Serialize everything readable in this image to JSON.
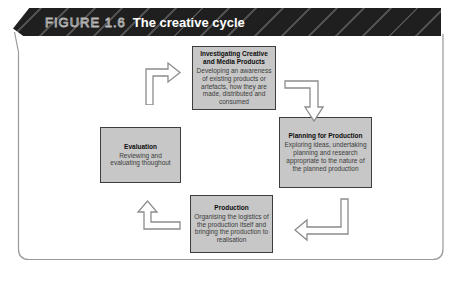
{
  "figure": {
    "label": "FIGURE 1.6",
    "title": "The creative cycle"
  },
  "cycle": {
    "nodes": [
      {
        "id": "investigating",
        "title": "Investigating Creative and Media Products",
        "body": "Developing an awareness of existing products or artefacts, how they are made, distributed and consumed"
      },
      {
        "id": "planning",
        "title": "Planning for Production",
        "body": "Exploring ideas, undertaking planning and research appropriate to the nature of the planned production"
      },
      {
        "id": "production",
        "title": "Production",
        "body": "Organising the logistics of the production itself and bringing the production to realisation"
      },
      {
        "id": "evaluation",
        "title": "Evaluation",
        "body": "Reviewing and evaluating thoughout"
      }
    ],
    "arrows": [
      {
        "from": "evaluation",
        "to": "investigating",
        "direction": "up-then-right"
      },
      {
        "from": "investigating",
        "to": "planning",
        "direction": "right-then-down"
      },
      {
        "from": "planning",
        "to": "production",
        "direction": "down-then-left"
      },
      {
        "from": "production",
        "to": "evaluation",
        "direction": "left-then-up"
      }
    ]
  },
  "colors": {
    "banner_background": "#1f1f1f",
    "banner_stripe": "#4a4a4a",
    "banner_title_text": "#ffffff",
    "banner_label_outline": "#b8b8b8",
    "node_fill": "#c7c7c7",
    "node_border": "#3d3d3d",
    "panel_border": "#999999",
    "arrow_outline": "#8c8c8c",
    "arrow_fill": "#ffffff"
  }
}
